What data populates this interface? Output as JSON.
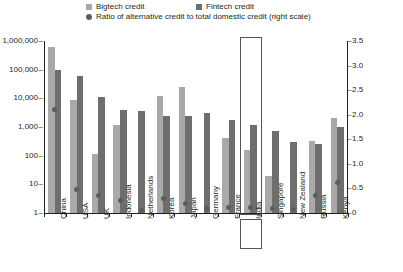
{
  "legend": {
    "items": [
      {
        "label": "Bigtech credit",
        "marker": "square",
        "color": "#a9a9a9"
      },
      {
        "label": "Fintech credit",
        "marker": "square",
        "color": "#6e6e6e"
      },
      {
        "label": "Ratio of alternative credit to total domestic credit (right scale)",
        "marker": "circle",
        "color": "#5c5c5c"
      }
    ]
  },
  "axes": {
    "left_ticks": [
      "1,000,000",
      "100,000",
      "10,000",
      "1,000",
      "100",
      "10",
      "1"
    ],
    "right_ticks": [
      "3.5",
      "3.0",
      "2.5",
      "2.0",
      "1.5",
      "1.0",
      "0.5",
      "0"
    ]
  },
  "highlight": {
    "country": "India"
  },
  "chart_data": {
    "type": "bar",
    "title": "",
    "subtitle": "",
    "xlabel": "",
    "ylabel": "",
    "y2label": "",
    "yscale": "log",
    "ylim": [
      1,
      1000000
    ],
    "y2lim": [
      0,
      3.5
    ],
    "grid": false,
    "legend_position": "top",
    "categories": [
      "China",
      "USA",
      "UK",
      "Indonesia",
      "Netherlands",
      "Korea",
      "Japan",
      "Germany",
      "France",
      "India",
      "Singapore",
      "New Zealand",
      "Russia",
      "Kenya"
    ],
    "series": [
      {
        "name": "Bigtech credit",
        "axis": "left",
        "color": "#a9a9a9",
        "values": [
          600000,
          9000,
          110,
          1200,
          null,
          12000,
          25000,
          null,
          420,
          160,
          20,
          null,
          330,
          2000
        ]
      },
      {
        "name": "Fintech credit",
        "axis": "left",
        "color": "#6e6e6e",
        "values": [
          100000,
          60000,
          11000,
          4000,
          3500,
          2500,
          2500,
          3000,
          1700,
          1200,
          700,
          300,
          250,
          1000
        ]
      },
      {
        "name": "Ratio of alternative credit to total domestic credit (right scale)",
        "axis": "right",
        "color": "#5c5c5c",
        "type": "scatter",
        "values": [
          2.1,
          0.47,
          0.35,
          0.25,
          0.05,
          0.3,
          0.2,
          0.1,
          0.12,
          0.12,
          0.1,
          0.08,
          0.35,
          0.62
        ]
      }
    ]
  }
}
